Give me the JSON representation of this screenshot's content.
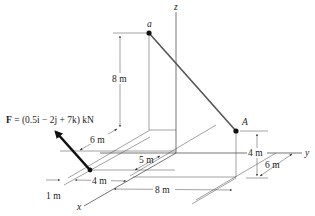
{
  "figure": {
    "type": "3D statics diagram",
    "points": {
      "a": {
        "label": "a"
      },
      "A": {
        "label": "A"
      }
    },
    "axes": {
      "x": "x",
      "y": "y",
      "z": "z"
    },
    "force": {
      "label_prefix": "F",
      "label_expression": " = (0.5i − 2j + 7k) kN",
      "components_kN": {
        "i": 0.5,
        "j": -2,
        "k": 7
      }
    },
    "dimensions": {
      "height_a": "8 m",
      "height_A": "4 m",
      "dim_6m_top": "6 m",
      "dim_5m": "5 m",
      "dim_4m_x": "4 m",
      "dim_1m": "1 m",
      "dim_8m_y": "8 m",
      "dim_6m_right": "6 m"
    }
  }
}
